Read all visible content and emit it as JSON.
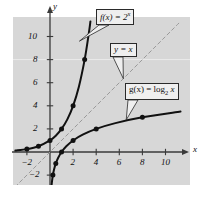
{
  "chart_data": {
    "type": "line",
    "title": "",
    "xlabel": "x",
    "ylabel": "y",
    "xlim": [
      -3,
      11.6
    ],
    "ylim": [
      -3.2,
      11.4
    ],
    "grid": false,
    "legend_position": "inline-callouts",
    "xticks": [
      -2,
      2,
      4,
      6,
      8,
      10
    ],
    "yticks": [
      -2,
      2,
      4,
      6,
      8,
      10
    ],
    "xtick_labels": [
      "−2",
      "2",
      "4",
      "6",
      "8",
      "10"
    ],
    "ytick_labels": [
      "−2",
      "2",
      "4",
      "6",
      "8",
      "10"
    ],
    "series": [
      {
        "name": "f(x) = 2^x",
        "style": "solid",
        "color": "#111111",
        "markers": true,
        "points": [
          [
            -2,
            0.25
          ],
          [
            -1,
            0.5
          ],
          [
            0,
            1
          ],
          [
            1,
            2
          ],
          [
            2,
            4
          ],
          [
            3,
            8
          ]
        ],
        "path": [
          [
            -3,
            0.125
          ],
          [
            -2,
            0.25
          ],
          [
            -1,
            0.5
          ],
          [
            0,
            1
          ],
          [
            0.5,
            1.414
          ],
          [
            1,
            2
          ],
          [
            1.5,
            2.828
          ],
          [
            2,
            4
          ],
          [
            2.5,
            5.657
          ],
          [
            3,
            8
          ],
          [
            3.35,
            10.2
          ],
          [
            3.5,
            11.3
          ]
        ]
      },
      {
        "name": "y = x",
        "style": "dashed",
        "color": "#9a9a9a",
        "markers": false,
        "points": [],
        "path": [
          [
            -3,
            -3
          ],
          [
            11.2,
            11.2
          ]
        ]
      },
      {
        "name": "g(x) = log2 x",
        "style": "solid",
        "color": "#111111",
        "markers": true,
        "points": [
          [
            0.25,
            -2
          ],
          [
            0.5,
            -1
          ],
          [
            1,
            0
          ],
          [
            2,
            1
          ],
          [
            4,
            2
          ],
          [
            8,
            3
          ]
        ],
        "path": [
          [
            0.125,
            -3
          ],
          [
            0.17,
            -2.56
          ],
          [
            0.25,
            -2
          ],
          [
            0.35,
            -1.51
          ],
          [
            0.5,
            -1
          ],
          [
            0.71,
            -0.5
          ],
          [
            1,
            0
          ],
          [
            1.41,
            0.5
          ],
          [
            2,
            1
          ],
          [
            2.83,
            1.5
          ],
          [
            4,
            2
          ],
          [
            5.66,
            2.5
          ],
          [
            8,
            3
          ],
          [
            11.3,
            3.5
          ]
        ]
      }
    ],
    "annotations": [
      {
        "id": "exp-label",
        "text": "f(x) = 2^x",
        "lead_to": [
          2.55,
          9.6
        ]
      },
      {
        "id": "identity-label",
        "text": "y = x",
        "lead_to": [
          6.35,
          6.35
        ]
      },
      {
        "id": "log-label",
        "text": "g(x) = log_2 x",
        "lead_to": [
          6.6,
          2.78
        ]
      }
    ]
  },
  "labels": {
    "axis_x": "x",
    "axis_y": "y",
    "exp_fn": "f(x) = 2",
    "exp_exponent": "x",
    "identity_fn": "y = x",
    "log_fn_head": "g(x) = log",
    "log_fn_base": "2",
    "log_fn_arg": "x",
    "ytick_10": "10",
    "ytick_8": "8",
    "ytick_6": "6",
    "ytick_4": "4",
    "ytick_2": "2",
    "ytick_m2": "−2",
    "xtick_m2": "−2",
    "xtick_2": "2",
    "xtick_4": "4",
    "xtick_6": "6",
    "xtick_8": "8",
    "xtick_10": "10"
  },
  "colors": {
    "plot_background": "#d7d7d7",
    "page_background": "#ffffff",
    "curve": "#111111",
    "dashed_line": "#9a9a9a",
    "axis": "#3a3a3a",
    "callout_fill": "#efefef",
    "callout_border": "#2a2a2a"
  }
}
